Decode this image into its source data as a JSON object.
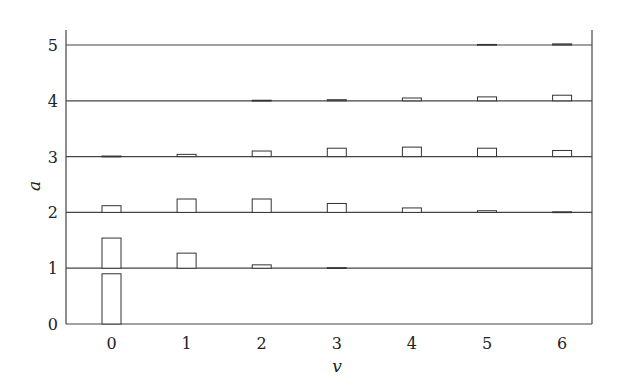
{
  "chart_data": {
    "type": "bar",
    "subtype": "stacked-row histogram (ridge of bar rows)",
    "title": "",
    "xlabel": "v",
    "ylabel": "a",
    "x_ticks": [
      "0",
      "1",
      "2",
      "3",
      "4",
      "5",
      "6"
    ],
    "y_ticks": [
      "0",
      "1",
      "2",
      "3",
      "4",
      "5"
    ],
    "xlim": [
      -0.6,
      6.4
    ],
    "ylim": [
      0,
      5.3
    ],
    "grid": false,
    "legend": null,
    "categories": [
      0,
      1,
      2,
      3,
      4,
      5,
      6
    ],
    "series": [
      {
        "name": "a=0",
        "baseline": 0,
        "values": [
          0.9,
          0,
          0,
          0,
          0,
          0,
          0
        ]
      },
      {
        "name": "a=1",
        "baseline": 1,
        "values": [
          0.54,
          0.27,
          0.06,
          0.01,
          0.0,
          0.0,
          0.0
        ]
      },
      {
        "name": "a=2",
        "baseline": 2,
        "values": [
          0.12,
          0.24,
          0.24,
          0.16,
          0.08,
          0.03,
          0.01
        ]
      },
      {
        "name": "a=3",
        "baseline": 3,
        "values": [
          0.01,
          0.04,
          0.1,
          0.15,
          0.17,
          0.15,
          0.11
        ]
      },
      {
        "name": "a=4",
        "baseline": 4,
        "values": [
          0.0,
          0.0,
          0.01,
          0.02,
          0.05,
          0.07,
          0.1
        ]
      },
      {
        "name": "a=5",
        "baseline": 5,
        "values": [
          0.0,
          0.0,
          0.0,
          0.0,
          0.0,
          0.01,
          0.02
        ]
      }
    ]
  },
  "style": {
    "line_color": "#444444",
    "bar_fill": "#ffffff",
    "bar_stroke": "#333333"
  }
}
